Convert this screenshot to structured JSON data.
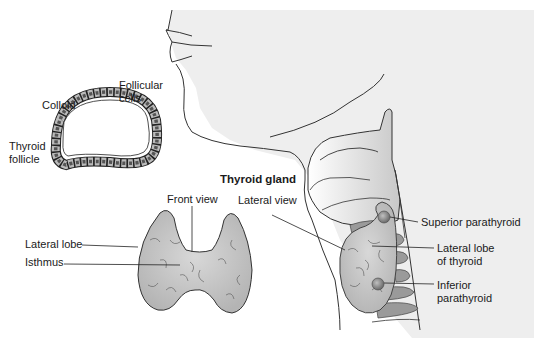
{
  "diagram": {
    "title": "Thyroid gland",
    "follicle_labels": {
      "follicular_cells_1": "Follicular",
      "follicular_cells_2": "cells",
      "colloid": "Colloid",
      "thyroid_follicle_1": "Thyroid",
      "thyroid_follicle_2": "follicle"
    },
    "front_view_labels": {
      "view": "Front view",
      "lateral_lobe": "Lateral lobe",
      "isthmus": "Isthmus"
    },
    "lateral_view_labels": {
      "view": "Lateral view",
      "superior_parathyroid": "Superior parathyroid",
      "lateral_lobe_1": "Lateral lobe",
      "lateral_lobe_2": "of thyroid",
      "inferior_parathyroid_1": "Inferior",
      "inferior_parathyroid_2": "parathyroid"
    },
    "colors": {
      "neck_background": "#eeeeee",
      "thyroid_fill": "#c4c4c4",
      "cartilage_fill": "#9a9a9a",
      "parathyroid_fill": "#8a8a8a",
      "line": "#333333"
    }
  }
}
